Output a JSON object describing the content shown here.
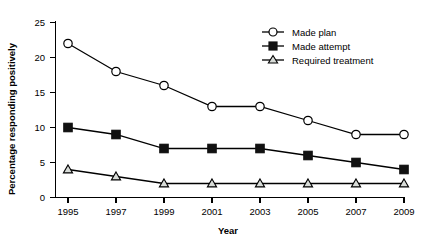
{
  "chart_data": {
    "type": "line",
    "title": "",
    "xlabel": "Year",
    "ylabel": "Percentage responding positively",
    "categories": [
      "1995",
      "1997",
      "1999",
      "2001",
      "2003",
      "2005",
      "2007",
      "2009"
    ],
    "x": [
      1995,
      1997,
      1999,
      2001,
      2003,
      2005,
      2007,
      2009
    ],
    "xlim": [
      1994,
      2010
    ],
    "ylim": [
      0,
      25
    ],
    "yticks": [
      0,
      5,
      10,
      15,
      20,
      25
    ],
    "ytick_labels": [
      "0",
      "5",
      "10",
      "15",
      "20",
      "25"
    ],
    "grid": false,
    "legend_position": "top-right",
    "series": [
      {
        "name": "Made plan",
        "marker": "open-circle",
        "color": "#000000",
        "values": [
          22,
          18,
          16,
          13,
          13,
          11,
          9,
          9
        ]
      },
      {
        "name": "Made attempt",
        "marker": "filled-square",
        "color": "#000000",
        "values": [
          10,
          9,
          7,
          7,
          7,
          6,
          5,
          4
        ]
      },
      {
        "name": "Required treatment",
        "marker": "open-triangle",
        "color": "#000000",
        "values": [
          4,
          3,
          2,
          2,
          2,
          2,
          2,
          2
        ]
      }
    ]
  },
  "legend": {
    "items": [
      {
        "label": "Made plan"
      },
      {
        "label": "Made attempt"
      },
      {
        "label": "Required treatment"
      }
    ]
  }
}
